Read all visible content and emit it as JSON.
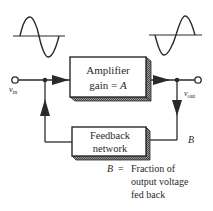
{
  "diagram": {
    "input_waveform": "sine-wave",
    "output_waveform": "inverted-sine-wave",
    "amplifier": {
      "line1": "Amplifier",
      "line2_prefix": "gain = ",
      "line2_var": "A"
    },
    "feedback_network": {
      "line1": "Feedback",
      "line2": "network"
    },
    "input_label": {
      "base": "v",
      "sub": "in"
    },
    "output_label": {
      "base": "v",
      "sub": "out"
    },
    "feedback_fraction_label": "B",
    "legend": {
      "var": "B",
      "eq": "=",
      "line1": "Fraction of",
      "line2": "output voltage",
      "line3": "fed back"
    },
    "colors": {
      "ink": "#2a2a2a",
      "shadow": "#6a6a6a",
      "background": "#ffffff"
    }
  }
}
